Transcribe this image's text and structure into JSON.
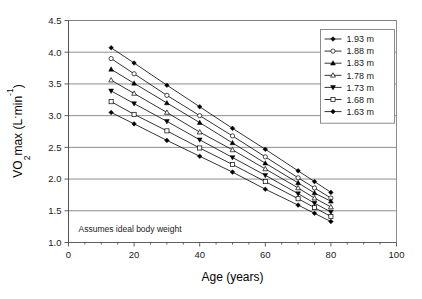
{
  "chart_data": {
    "type": "line",
    "title": "",
    "subtitle": "",
    "xlabel": "Age (years)",
    "ylabel": "VO2max (L·min-1)",
    "ylabel_parts": {
      "v_dot": "V",
      "o": "O",
      "sub": "2",
      "max": "max (L",
      "middot": "·",
      "min": "min",
      "sup": "-1",
      "close": ")"
    },
    "xlim": [
      0,
      100
    ],
    "ylim": [
      1.0,
      4.5
    ],
    "xticks": [
      0,
      20,
      40,
      60,
      80,
      100
    ],
    "xtick_labels": [
      "0",
      "20",
      "40",
      "60",
      "80",
      "100"
    ],
    "yticks": [
      1.0,
      1.5,
      2.0,
      2.5,
      3.0,
      3.5,
      4.0,
      4.5
    ],
    "ytick_labels": [
      "1.0",
      "1.5",
      "2.0",
      "2.5",
      "3.0",
      "3.5",
      "4.0",
      "4.5"
    ],
    "grid": "horizontal",
    "legend_position": "top-right",
    "annotation": "Assumes ideal body weight",
    "x": [
      13,
      20,
      30,
      40,
      50,
      60,
      70,
      75,
      80
    ],
    "series": [
      {
        "name": "1.93 m",
        "marker": "filled-diamond",
        "values": [
          4.07,
          3.83,
          3.48,
          3.14,
          2.8,
          2.47,
          2.13,
          1.96,
          1.79
        ]
      },
      {
        "name": "1.88 m",
        "marker": "open-circle",
        "values": [
          3.9,
          3.66,
          3.32,
          3.0,
          2.68,
          2.35,
          2.02,
          1.86,
          1.7
        ]
      },
      {
        "name": "1.83 m",
        "marker": "filled-triangle",
        "values": [
          3.73,
          3.51,
          3.2,
          2.89,
          2.57,
          2.25,
          1.94,
          1.78,
          1.65
        ]
      },
      {
        "name": "1.78 m",
        "marker": "open-triangle",
        "values": [
          3.56,
          3.35,
          3.05,
          2.74,
          2.46,
          2.16,
          1.86,
          1.7,
          1.56
        ]
      },
      {
        "name": "1.73 m",
        "marker": "filled-inverted-triangle",
        "values": [
          3.39,
          3.19,
          2.91,
          2.62,
          2.34,
          2.06,
          1.77,
          1.62,
          1.48
        ]
      },
      {
        "name": "1.68 m",
        "marker": "open-square",
        "values": [
          3.22,
          3.02,
          2.76,
          2.49,
          2.23,
          1.96,
          1.69,
          1.55,
          1.41
        ]
      },
      {
        "name": "1.63 m",
        "marker": "filled-diamond",
        "values": [
          3.05,
          2.87,
          2.61,
          2.36,
          2.11,
          1.84,
          1.59,
          1.46,
          1.33
        ]
      }
    ]
  }
}
